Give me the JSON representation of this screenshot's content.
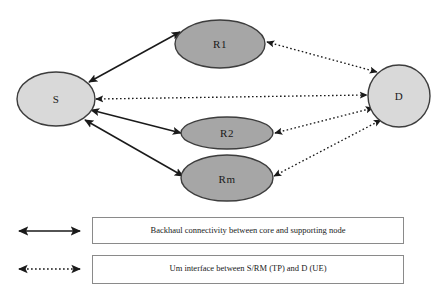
{
  "diagram": {
    "nodes": [
      {
        "id": "S",
        "label": "S",
        "role": "source-node",
        "shade": "light",
        "cx": 56,
        "cy": 99,
        "rx": 39,
        "ry": 27
      },
      {
        "id": "R1",
        "label": "R1",
        "role": "relay-node",
        "shade": "dark",
        "cx": 220,
        "cy": 44,
        "rx": 45,
        "ry": 24
      },
      {
        "id": "R2",
        "label": "R2",
        "role": "relay-node",
        "shade": "dark",
        "cx": 227,
        "cy": 133,
        "rx": 46,
        "ry": 16
      },
      {
        "id": "Rm",
        "label": "Rm",
        "role": "relay-node",
        "shade": "dark",
        "cx": 227,
        "cy": 178,
        "rx": 46,
        "ry": 23
      },
      {
        "id": "D",
        "label": "D",
        "role": "destination-node",
        "shade": "light",
        "cx": 399,
        "cy": 96,
        "rx": 31,
        "ry": 31
      }
    ],
    "links": [
      {
        "id": "s-r1",
        "from": "S",
        "to": "R1",
        "style": "solid",
        "type": "backhaul"
      },
      {
        "id": "s-r2",
        "from": "S",
        "to": "R2",
        "style": "solid",
        "type": "backhaul"
      },
      {
        "id": "s-rm",
        "from": "S",
        "to": "Rm",
        "style": "solid",
        "type": "backhaul"
      },
      {
        "id": "s-d",
        "from": "S",
        "to": "D",
        "style": "dotted",
        "type": "um-interface"
      },
      {
        "id": "r1-d",
        "from": "R1",
        "to": "D",
        "style": "dotted",
        "type": "um-interface"
      },
      {
        "id": "r2-d",
        "from": "R2",
        "to": "D",
        "style": "dotted",
        "type": "um-interface"
      },
      {
        "id": "rm-d",
        "from": "Rm",
        "to": "D",
        "style": "dotted",
        "type": "um-interface"
      }
    ],
    "colors": {
      "node_light_fill": "#d9d9d9",
      "node_dark_fill": "#a6a6a6",
      "node_stroke": "#3d3d3d",
      "line": "#1a1a1a",
      "legend_border": "#8a8a8a",
      "background": "#ffffff"
    }
  },
  "legend": {
    "items": [
      {
        "id": "backhaul",
        "sample_style": "solid",
        "sample_name": "double-headed-solid-arrow",
        "text": "Backhaul connectivity between core and supporting node"
      },
      {
        "id": "um-interface",
        "sample_style": "dotted",
        "sample_name": "double-headed-dotted-arrow",
        "text": "Um interface between S/RM (TP) and D (UE)"
      }
    ]
  }
}
